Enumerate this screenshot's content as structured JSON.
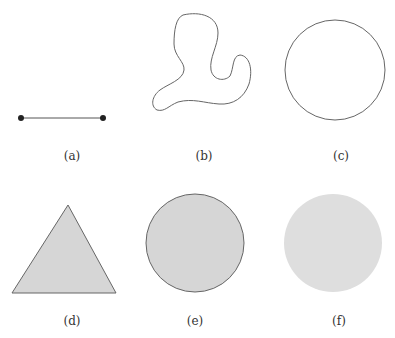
{
  "panels": [
    {
      "id": "a",
      "label": "(a)",
      "shape": "line-segment"
    },
    {
      "id": "b",
      "label": "(b)",
      "shape": "closed-curve"
    },
    {
      "id": "c",
      "label": "(c)",
      "shape": "circle"
    },
    {
      "id": "d",
      "label": "(d)",
      "shape": "filled-triangle"
    },
    {
      "id": "e",
      "label": "(e)",
      "shape": "filled-disk-with-boundary"
    },
    {
      "id": "f",
      "label": "(f)",
      "shape": "filled-disk-without-boundary"
    }
  ],
  "colors": {
    "stroke": "#555555",
    "fill": "#d6d6d6",
    "fill_light": "#dedede",
    "point": "#222222"
  }
}
